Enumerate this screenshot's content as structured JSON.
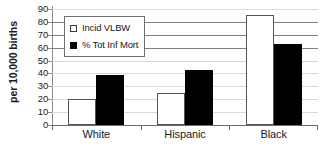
{
  "chart_data": {
    "type": "bar",
    "title": "",
    "xlabel": "",
    "ylabel": "per 10,000 births",
    "ylim": [
      0,
      90
    ],
    "ytick_step": 10,
    "yticks": [
      0,
      10,
      20,
      30,
      40,
      50,
      60,
      70,
      80,
      90
    ],
    "grid": true,
    "legend_position": "upper-left-inside",
    "categories": [
      "White",
      "Hispanic",
      "Black"
    ],
    "series": [
      {
        "name": "Incid VLBW",
        "style": "open",
        "color": "#ffffff",
        "edge_color": "#555555",
        "values": [
          20,
          25,
          85
        ]
      },
      {
        "name": "% Tot Inf Mort",
        "style": "solid",
        "color": "#000000",
        "edge_color": "#000000",
        "values": [
          39,
          43,
          63
        ]
      }
    ]
  },
  "legend": {
    "items": [
      {
        "label": "Incid VLBW",
        "swatch": "open-square-icon"
      },
      {
        "label": "% Tot Inf Mort",
        "swatch": "filled-square-icon"
      }
    ]
  },
  "axis": {
    "y_title": "per 10,000 births",
    "y_tick_labels": [
      "90",
      "80",
      "70",
      "60",
      "50",
      "40",
      "30",
      "20",
      "10",
      "0"
    ],
    "x_tick_labels": [
      "White",
      "Hispanic",
      "Black"
    ]
  },
  "colors": {
    "background": "#ffffff",
    "grid_light": "#d9d9d9",
    "grid_strong": "#808080",
    "axis": "#6b6b6b",
    "text": "#1a1a1a",
    "series_open": "#ffffff",
    "series_solid": "#000000"
  }
}
